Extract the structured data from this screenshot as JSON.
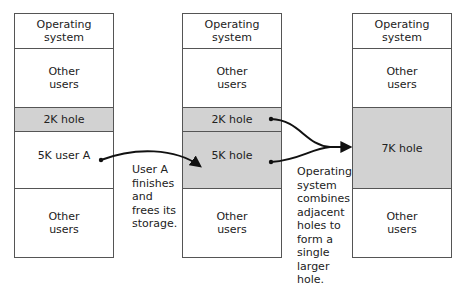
{
  "diagram": {
    "title": "",
    "columns": [
      {
        "id": "before",
        "segments": [
          {
            "label": "Operating\nsystem",
            "type": "os"
          },
          {
            "label": "Other\nusers",
            "type": "used"
          },
          {
            "label": "2K hole",
            "type": "hole"
          },
          {
            "label": "5K user A",
            "type": "used"
          },
          {
            "label": "Other\nusers",
            "type": "used"
          }
        ]
      },
      {
        "id": "after-free",
        "segments": [
          {
            "label": "Operating\nsystem",
            "type": "os"
          },
          {
            "label": "Other\nusers",
            "type": "used"
          },
          {
            "label": "2K hole",
            "type": "hole"
          },
          {
            "label": "5K hole",
            "type": "hole"
          },
          {
            "label": "Other\nusers",
            "type": "used"
          }
        ]
      },
      {
        "id": "after-coalesce",
        "segments": [
          {
            "label": "Operating\nsystem",
            "type": "os"
          },
          {
            "label": "Other\nusers",
            "type": "used"
          },
          {
            "label": "7K hole",
            "type": "hole"
          },
          {
            "label": "Other\nusers",
            "type": "used"
          }
        ]
      }
    ],
    "annotations": [
      {
        "text": "User A\nfinishes\nand\nfrees its\nstorage."
      },
      {
        "text": "Operating\nsystem\ncombines\nadjacent\nholes to\nform a\nsingle\nlarger\nhole."
      }
    ],
    "edges": [
      {
        "from": "5K user A",
        "to": "5K hole"
      },
      {
        "from": "2K hole",
        "to": "7K hole"
      },
      {
        "from": "5K hole",
        "to": "7K hole"
      }
    ],
    "colors": {
      "hole_fill": "#d2d2d2",
      "border": "#555555",
      "arrow": "#111111"
    }
  }
}
